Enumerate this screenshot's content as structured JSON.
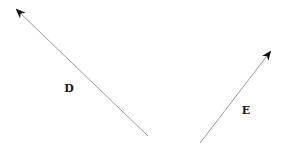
{
  "diagram": {
    "background": "#ffffff",
    "vectors": [
      {
        "id": "D",
        "label": "D",
        "tail": [
          148,
          136
        ],
        "head": [
          17,
          10
        ],
        "label_pos": [
          69,
          88
        ],
        "line_color": "#9a9a9a",
        "head_color": "#111111"
      },
      {
        "id": "E",
        "label": "E",
        "tail": [
          200,
          143
        ],
        "head": [
          270,
          52
        ],
        "label_pos": [
          246,
          110
        ],
        "line_color": "#9a9a9a",
        "head_color": "#111111"
      }
    ]
  }
}
